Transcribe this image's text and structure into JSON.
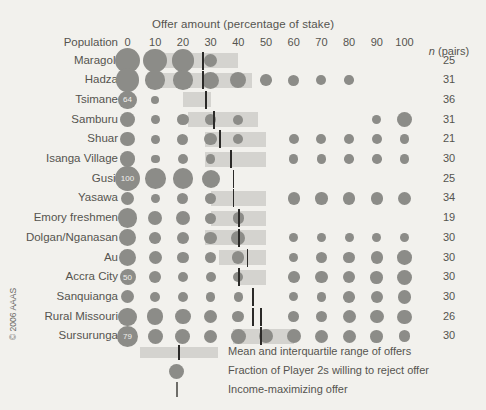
{
  "chart": {
    "title": "Offer amount (percentage of stake)",
    "population_header": "Population",
    "n_header_italic": "n",
    "n_header_rest": " (pairs)",
    "copyright": "© 2006 AAAS"
  },
  "legend": {
    "items": [
      {
        "icon": "band-swatch",
        "label": "Mean and interquartile range of offers"
      },
      {
        "icon": "bubble-swatch",
        "label": "Fraction of Player 2s willing to reject offer"
      },
      {
        "icon": "line-swatch",
        "label": "Income-maximizing offer"
      }
    ]
  },
  "colors": {
    "background": "#f2f1ed",
    "band": "#d4d3cf",
    "bubble": "#8c8c88",
    "income_line": "#2b2a28",
    "text": "#55544f"
  },
  "chart_data": {
    "type": "bubble",
    "title": "Offer amount (percentage of stake)",
    "xlabel": "Offer amount (percentage of stake)",
    "ylabel": "Population",
    "xlim": [
      0,
      100
    ],
    "xticks": [
      0,
      10,
      20,
      30,
      40,
      50,
      60,
      70,
      80,
      90,
      100
    ],
    "grid": false,
    "legend_position": "bottom-center",
    "series_description": "Bubble area = fraction of Player 2s willing to reject an offer of that amount; grey band = interquartile range of offers with black tick at the mean; vertical line = income-maximizing offer.",
    "rows": [
      {
        "population": "Maragoli",
        "n": 25,
        "iqr": [
          12,
          40
        ],
        "mean": 27,
        "income_max": null,
        "rejection": [
          {
            "offer": 0,
            "size": 1.0
          },
          {
            "offer": 10,
            "size": 0.92
          },
          {
            "offer": 20,
            "size": 0.86
          },
          {
            "offer": 30,
            "size": 0.36
          }
        ]
      },
      {
        "population": "Hadza",
        "n": 31,
        "iqr": [
          12,
          45
        ],
        "mean": 27,
        "income_max": null,
        "rejection": [
          {
            "offer": 0,
            "size": 0.92
          },
          {
            "offer": 10,
            "size": 0.7
          },
          {
            "offer": 20,
            "size": 0.7
          },
          {
            "offer": 30,
            "size": 0.56
          },
          {
            "offer": 40,
            "size": 0.52
          },
          {
            "offer": 50,
            "size": 0.26
          },
          {
            "offer": 60,
            "size": 0.24
          },
          {
            "offer": 70,
            "size": 0.16
          },
          {
            "offer": 80,
            "size": 0.14
          }
        ]
      },
      {
        "population": "Tsimane",
        "n": 36,
        "iqr": [
          20,
          30
        ],
        "mean": 28,
        "income_max": null,
        "rejection": [
          {
            "offer": 0,
            "size": 0.64,
            "label": "64"
          },
          {
            "offer": 10,
            "size": 0.08
          }
        ]
      },
      {
        "population": "Samburu",
        "n": 31,
        "iqr": [
          22,
          47
        ],
        "mean": 31,
        "income_max": null,
        "rejection": [
          {
            "offer": 0,
            "size": 0.44
          },
          {
            "offer": 10,
            "size": 0.1
          },
          {
            "offer": 20,
            "size": 0.26
          },
          {
            "offer": 30,
            "size": 0.2
          },
          {
            "offer": 40,
            "size": 0.16
          },
          {
            "offer": 90,
            "size": 0.12
          },
          {
            "offer": 100,
            "size": 0.44
          }
        ]
      },
      {
        "population": "Shuar",
        "n": 21,
        "iqr": [
          28,
          50
        ],
        "mean": 33,
        "income_max": null,
        "rejection": [
          {
            "offer": 0,
            "size": 0.4
          },
          {
            "offer": 10,
            "size": 0.1
          },
          {
            "offer": 20,
            "size": 0.22
          },
          {
            "offer": 30,
            "size": 0.3
          },
          {
            "offer": 40,
            "size": 0.18
          },
          {
            "offer": 60,
            "size": 0.16
          },
          {
            "offer": 70,
            "size": 0.16
          },
          {
            "offer": 80,
            "size": 0.16
          },
          {
            "offer": 90,
            "size": 0.16
          },
          {
            "offer": 100,
            "size": 0.16
          }
        ]
      },
      {
        "population": "Isanga Village",
        "n": 30,
        "iqr": [
          28,
          50
        ],
        "mean": 37,
        "income_max": null,
        "rejection": [
          {
            "offer": 0,
            "size": 0.46
          },
          {
            "offer": 10,
            "size": 0.1
          },
          {
            "offer": 20,
            "size": 0.2
          },
          {
            "offer": 30,
            "size": 0.14
          },
          {
            "offer": 60,
            "size": 0.14
          },
          {
            "offer": 70,
            "size": 0.14
          },
          {
            "offer": 80,
            "size": 0.14
          },
          {
            "offer": 90,
            "size": 0.14
          },
          {
            "offer": 100,
            "size": 0.14
          }
        ]
      },
      {
        "population": "Gusii",
        "n": 25,
        "iqr": null,
        "mean": null,
        "income_max": 38,
        "rejection": [
          {
            "offer": 0,
            "size": 1.0,
            "label": "100"
          },
          {
            "offer": 10,
            "size": 0.76
          },
          {
            "offer": 20,
            "size": 0.76
          },
          {
            "offer": 30,
            "size": 0.62
          }
        ]
      },
      {
        "population": "Yasawa",
        "n": 34,
        "iqr": [
          30,
          50
        ],
        "mean": 38,
        "income_max": 38,
        "rejection": [
          {
            "offer": 0,
            "size": 0.34
          },
          {
            "offer": 10,
            "size": 0.12
          },
          {
            "offer": 20,
            "size": 0.22
          },
          {
            "offer": 30,
            "size": 0.26
          },
          {
            "offer": 60,
            "size": 0.3
          },
          {
            "offer": 70,
            "size": 0.3
          },
          {
            "offer": 80,
            "size": 0.3
          },
          {
            "offer": 90,
            "size": 0.3
          },
          {
            "offer": 100,
            "size": 0.34
          }
        ]
      },
      {
        "population": "Emory freshmen",
        "n": 19,
        "iqr": [
          30,
          50
        ],
        "mean": 40,
        "income_max": 40,
        "rejection": [
          {
            "offer": 0,
            "size": 0.7
          },
          {
            "offer": 10,
            "size": 0.38
          },
          {
            "offer": 20,
            "size": 0.38
          },
          {
            "offer": 30,
            "size": 0.22
          },
          {
            "offer": 40,
            "size": 0.24
          }
        ]
      },
      {
        "population": "Dolgan/Nganasan",
        "n": 30,
        "iqr": [
          28,
          50
        ],
        "mean": 40,
        "income_max": null,
        "rejection": [
          {
            "offer": 0,
            "size": 0.56
          },
          {
            "offer": 10,
            "size": 0.26
          },
          {
            "offer": 20,
            "size": 0.28
          },
          {
            "offer": 30,
            "size": 0.3
          },
          {
            "offer": 40,
            "size": 0.38
          },
          {
            "offer": 60,
            "size": 0.12
          },
          {
            "offer": 70,
            "size": 0.12
          },
          {
            "offer": 80,
            "size": 0.12
          },
          {
            "offer": 90,
            "size": 0.12
          },
          {
            "offer": 100,
            "size": 0.12
          }
        ]
      },
      {
        "population": "Au",
        "n": 30,
        "iqr": [
          33,
          50
        ],
        "mean": 43,
        "income_max": null,
        "rejection": [
          {
            "offer": 0,
            "size": 0.6
          },
          {
            "offer": 10,
            "size": 0.34
          },
          {
            "offer": 20,
            "size": 0.24
          },
          {
            "offer": 30,
            "size": 0.22
          },
          {
            "offer": 40,
            "size": 0.3
          },
          {
            "offer": 60,
            "size": 0.1
          },
          {
            "offer": 70,
            "size": 0.22
          },
          {
            "offer": 80,
            "size": 0.24
          },
          {
            "offer": 90,
            "size": 0.3
          },
          {
            "offer": 100,
            "size": 0.42
          }
        ]
      },
      {
        "population": "Accra City",
        "n": 30,
        "iqr": [
          40,
          50
        ],
        "mean": 40,
        "income_max": null,
        "rejection": [
          {
            "offer": 0,
            "size": 0.5,
            "label": "50"
          },
          {
            "offer": 10,
            "size": 0.28
          },
          {
            "offer": 20,
            "size": 0.2
          },
          {
            "offer": 30,
            "size": 0.16
          },
          {
            "offer": 40,
            "size": 0.18
          },
          {
            "offer": 60,
            "size": 0.26
          },
          {
            "offer": 70,
            "size": 0.3
          },
          {
            "offer": 80,
            "size": 0.3
          },
          {
            "offer": 90,
            "size": 0.32
          },
          {
            "offer": 100,
            "size": 0.46
          }
        ]
      },
      {
        "population": "Sanquianga",
        "n": 30,
        "iqr": null,
        "mean": null,
        "income_max": 45,
        "rejection": [
          {
            "offer": 0,
            "size": 0.34
          },
          {
            "offer": 10,
            "size": 0.18
          },
          {
            "offer": 20,
            "size": 0.2
          },
          {
            "offer": 30,
            "size": 0.14
          },
          {
            "offer": 40,
            "size": 0.14
          },
          {
            "offer": 60,
            "size": 0.12
          },
          {
            "offer": 70,
            "size": 0.14
          },
          {
            "offer": 80,
            "size": 0.26
          },
          {
            "offer": 90,
            "size": 0.3
          },
          {
            "offer": 100,
            "size": 0.36
          }
        ]
      },
      {
        "population": "Rural Missouri",
        "n": 26,
        "iqr": null,
        "mean": null,
        "income_max": 45,
        "income_max_2": 48,
        "rejection": [
          {
            "offer": 0,
            "size": 0.62
          },
          {
            "offer": 10,
            "size": 0.52
          },
          {
            "offer": 20,
            "size": 0.46
          },
          {
            "offer": 30,
            "size": 0.36
          },
          {
            "offer": 40,
            "size": 0.26
          },
          {
            "offer": 60,
            "size": 0.2
          },
          {
            "offer": 70,
            "size": 0.24
          },
          {
            "offer": 80,
            "size": 0.34
          },
          {
            "offer": 90,
            "size": 0.36
          },
          {
            "offer": 100,
            "size": 0.4
          }
        ]
      },
      {
        "population": "Sursurunga",
        "n": 30,
        "iqr": [
          38,
          60
        ],
        "mean": 48,
        "income_max": null,
        "rejection": [
          {
            "offer": 0,
            "size": 0.79,
            "label": "79"
          },
          {
            "offer": 10,
            "size": 0.44
          },
          {
            "offer": 20,
            "size": 0.44
          },
          {
            "offer": 30,
            "size": 0.36
          },
          {
            "offer": 40,
            "size": 0.44
          },
          {
            "offer": 50,
            "size": 0.4
          },
          {
            "offer": 60,
            "size": 0.4
          },
          {
            "offer": 70,
            "size": 0.34
          },
          {
            "offer": 80,
            "size": 0.34
          },
          {
            "offer": 90,
            "size": 0.32
          },
          {
            "offer": 100,
            "size": 0.26
          }
        ]
      }
    ]
  }
}
